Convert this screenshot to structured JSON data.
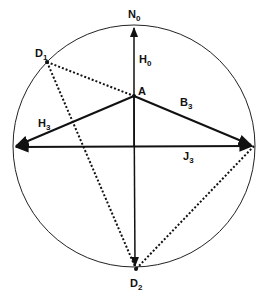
{
  "diagram": {
    "circle": {
      "cx": 134,
      "cy": 146,
      "r": 121
    },
    "points": {
      "A": {
        "x": 134,
        "y": 96
      },
      "D1": {
        "x": 47,
        "y": 62
      },
      "D2": {
        "x": 136,
        "y": 269
      },
      "left": {
        "x": 13,
        "y": 147
      },
      "right": {
        "x": 254,
        "y": 146
      },
      "top": {
        "x": 134,
        "y": 25
      }
    },
    "labels": {
      "N": {
        "main": "N",
        "sub": "0"
      },
      "H0": {
        "main": "H",
        "sub": "0"
      },
      "A": {
        "main": "A",
        "sub": ""
      },
      "D1": {
        "main": "D",
        "sub": "1"
      },
      "B3": {
        "main": "B",
        "sub": "3"
      },
      "H3": {
        "main": "H",
        "sub": "3"
      },
      "J3": {
        "main": "J",
        "sub": "3"
      },
      "D2": {
        "main": "D",
        "sub": "2"
      }
    },
    "colors": {
      "stroke": "#111111",
      "background": "#ffffff"
    }
  }
}
